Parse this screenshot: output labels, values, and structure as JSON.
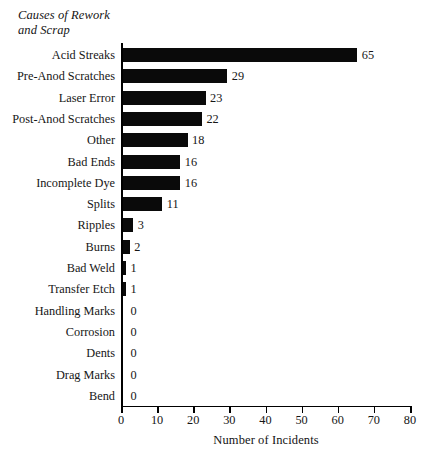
{
  "chart_data": {
    "type": "bar",
    "orientation": "horizontal",
    "title": "",
    "xlabel": "Number of Incidents",
    "ylabel": "Causes of Rework\nand Scrap",
    "xlim": [
      0,
      80
    ],
    "xticks": [
      0,
      10,
      20,
      30,
      40,
      50,
      60,
      70,
      80
    ],
    "xtick_labels": [
      "0",
      "10",
      "20",
      "30",
      "40",
      "50",
      "60",
      "70",
      "80"
    ],
    "grid": false,
    "legend": false,
    "bar_color": "#0a0a0a",
    "background": "#ffffff",
    "categories": [
      "Acid Streaks",
      "Pre-Anod Scratches",
      "Laser Error",
      "Post-Anod Scratches",
      "Other",
      "Bad Ends",
      "Incomplete Dye",
      "Splits",
      "Ripples",
      "Burns",
      "Bad Weld",
      "Transfer Etch",
      "Handling Marks",
      "Corrosion",
      "Dents",
      "Drag Marks",
      "Bend"
    ],
    "values": [
      65,
      29,
      23,
      22,
      18,
      16,
      16,
      11,
      3,
      2,
      1,
      1,
      0,
      0,
      0,
      0,
      0
    ],
    "data_labels": [
      "65",
      "29",
      "23",
      "22",
      "18",
      "16",
      "16",
      "11",
      "3",
      "2",
      "1",
      "1",
      "0",
      "0",
      "0",
      "0",
      "0"
    ]
  }
}
